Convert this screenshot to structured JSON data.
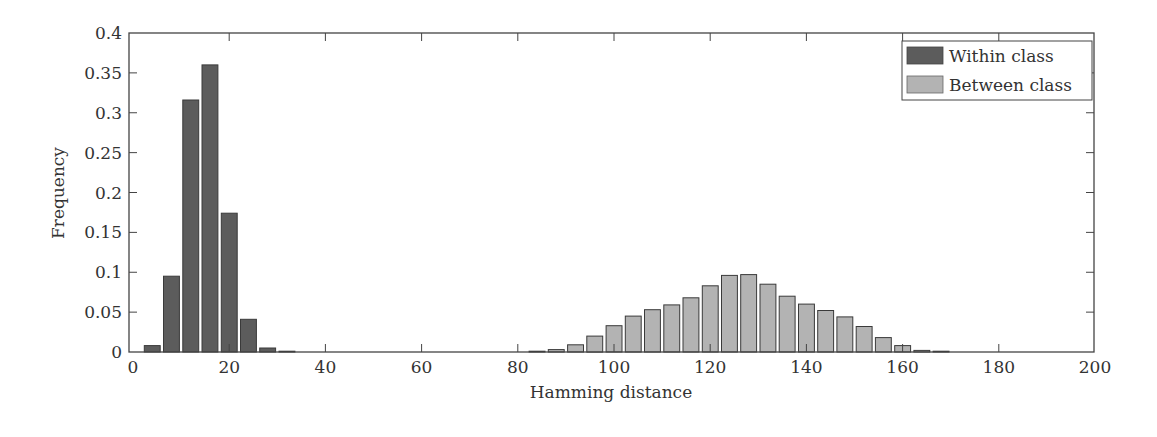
{
  "chart_data": {
    "type": "bar",
    "title": "",
    "xlabel": "Hamming distance",
    "ylabel": "Frequency",
    "xlim": [
      0,
      200
    ],
    "ylim": [
      0,
      0.4
    ],
    "xticks": [
      0,
      20,
      40,
      60,
      80,
      100,
      120,
      140,
      160,
      180,
      200
    ],
    "yticks": [
      0,
      0.05,
      0.1,
      0.15,
      0.2,
      0.25,
      0.3,
      0.35,
      0.4
    ],
    "ytick_labels": [
      "0",
      "0.05",
      "0.1",
      "0.15",
      "0.2",
      "0.25",
      "0.3",
      "0.35",
      "0.4"
    ],
    "grid": false,
    "legend_position": "upper right",
    "bar_width": 3.3,
    "series": [
      {
        "name": "Within class",
        "color": "#5c5c5c",
        "x": [
          4,
          8,
          12,
          16,
          20,
          24,
          28,
          32
        ],
        "values": [
          0.008,
          0.095,
          0.316,
          0.36,
          0.174,
          0.041,
          0.005,
          0.001
        ]
      },
      {
        "name": "Between class",
        "color": "#b3b3b3",
        "x": [
          84,
          88,
          92,
          96,
          100,
          104,
          108,
          112,
          116,
          120,
          124,
          128,
          132,
          136,
          140,
          144,
          148,
          152,
          156,
          160,
          164,
          168
        ],
        "values": [
          0.001,
          0.003,
          0.009,
          0.02,
          0.033,
          0.045,
          0.053,
          0.059,
          0.068,
          0.083,
          0.096,
          0.097,
          0.085,
          0.07,
          0.06,
          0.052,
          0.044,
          0.032,
          0.018,
          0.008,
          0.002,
          0.001
        ]
      }
    ]
  },
  "legend": {
    "items": [
      {
        "label": "Within class",
        "color": "#5c5c5c"
      },
      {
        "label": "Between class",
        "color": "#b3b3b3"
      }
    ]
  },
  "axes": {
    "xlabel": "Hamming distance",
    "ylabel": "Frequency"
  }
}
